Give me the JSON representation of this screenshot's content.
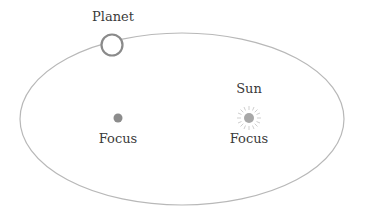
{
  "diagram": {
    "labels": {
      "planet": "Planet",
      "sun": "Sun",
      "focus_left": "Focus",
      "focus_right": "Focus"
    },
    "orbit": {
      "cx": 182,
      "cy": 119,
      "rx": 162,
      "ry": 86,
      "stroke": "#b8b8b8"
    },
    "planet": {
      "x": 112,
      "y": 45,
      "r": 11,
      "stroke": "#8a8a8a",
      "fill": "#ffffff"
    },
    "focus_left": {
      "x": 118,
      "y": 118,
      "r": 4.5,
      "fill": "#8c8c8c"
    },
    "sun": {
      "x": 249,
      "y": 118,
      "r": 5,
      "fill": "#a8a8a8",
      "ray_color": "#c8c8c8"
    }
  }
}
